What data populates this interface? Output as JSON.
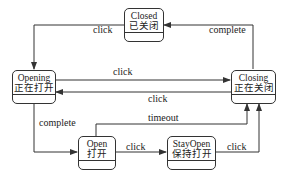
{
  "diagram": {
    "type": "state-machine",
    "line_color": "#333333",
    "states": [
      {
        "id": "closed",
        "name": "Closed",
        "name_zh": "已关闭"
      },
      {
        "id": "opening",
        "name": "Opening",
        "name_zh": "正在打开"
      },
      {
        "id": "closing",
        "name": "Closing",
        "name_zh": "正在关闭"
      },
      {
        "id": "open",
        "name": "Open",
        "name_zh": "打开"
      },
      {
        "id": "stayopen",
        "name": "StayOpen",
        "name_zh": "保持打开"
      }
    ],
    "transitions": [
      {
        "from": "closed",
        "to": "opening",
        "label": "click"
      },
      {
        "from": "closing",
        "to": "closed",
        "label": "complete"
      },
      {
        "from": "opening",
        "to": "closing",
        "label": "click"
      },
      {
        "from": "closing",
        "to": "opening",
        "label": "click"
      },
      {
        "from": "opening",
        "to": "open",
        "label": "complete"
      },
      {
        "from": "open",
        "to": "closing",
        "label": "timeout"
      },
      {
        "from": "open",
        "to": "stayopen",
        "label": "click"
      },
      {
        "from": "stayopen",
        "to": "closing",
        "label": "click"
      }
    ]
  }
}
